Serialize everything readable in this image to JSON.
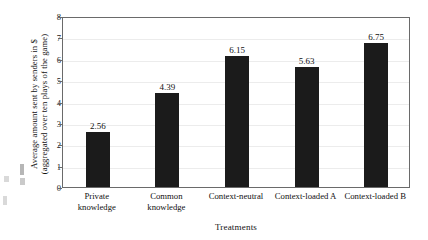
{
  "chart_data": {
    "type": "bar",
    "title": "",
    "categories": [
      "Private knowledge",
      "Common knowledge",
      "Context-neutral",
      "Context-loaded A",
      "Context-loaded B"
    ],
    "category_lines": [
      [
        "Private",
        "knowledge"
      ],
      [
        "Common",
        "knowledge"
      ],
      [
        "Context-neutral"
      ],
      [
        "Context-loaded A"
      ],
      [
        "Context-loaded B"
      ]
    ],
    "values": [
      2.56,
      4.39,
      6.15,
      5.63,
      6.75
    ],
    "value_labels": [
      "2.56",
      "4.39",
      "6.15",
      "5.63",
      "6.75"
    ],
    "xlabel": "Treatments",
    "ylabel_line1": "Average amount sent by senders in $",
    "ylabel_line2": "(aggregated over ten plays of the game)",
    "ylim": [
      0,
      8
    ],
    "yticks": [
      0,
      1,
      2,
      3,
      4,
      5,
      6,
      7,
      8
    ],
    "ytick_labels": [
      "0",
      "1",
      "2",
      "3",
      "4",
      "5",
      "6",
      "7",
      "8"
    ],
    "grid": true,
    "legend": "none",
    "bar_color": "#1b1b1b",
    "frame_color": "#6a6a6a",
    "grid_color": "#ececec"
  }
}
